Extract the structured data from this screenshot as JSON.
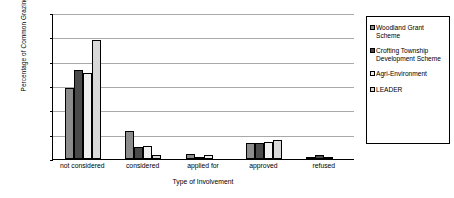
{
  "chart_data": {
    "type": "bar",
    "title": "",
    "xlabel": "Type of Involvement",
    "ylabel": "Percentage of Common Grazings (%)",
    "ylim": [
      0,
      120
    ],
    "ytick_step": 20,
    "yticks": [
      "0",
      "20",
      "40",
      "60",
      "80",
      "100",
      "120"
    ],
    "grid": true,
    "legend_position": "right-outside",
    "categories": [
      "not considered",
      "considered",
      "applied for",
      "approved",
      "refused"
    ],
    "series": [
      {
        "name": "Woodland Grant Scheme",
        "color": "#8c8c8c",
        "values": [
          58,
          23,
          4,
          13,
          2
        ]
      },
      {
        "name": "Crofting Township Development Scheme",
        "color": "#4a4a4a",
        "values": [
          73,
          10,
          2,
          13,
          3
        ]
      },
      {
        "name": "Agri-Environment",
        "color": "#efefef",
        "values": [
          71,
          11,
          3.5,
          14,
          1.5
        ]
      },
      {
        "name": "LEADER",
        "color": "#d8d8d8",
        "values": [
          98,
          3,
          0,
          15.5,
          0
        ]
      }
    ]
  }
}
